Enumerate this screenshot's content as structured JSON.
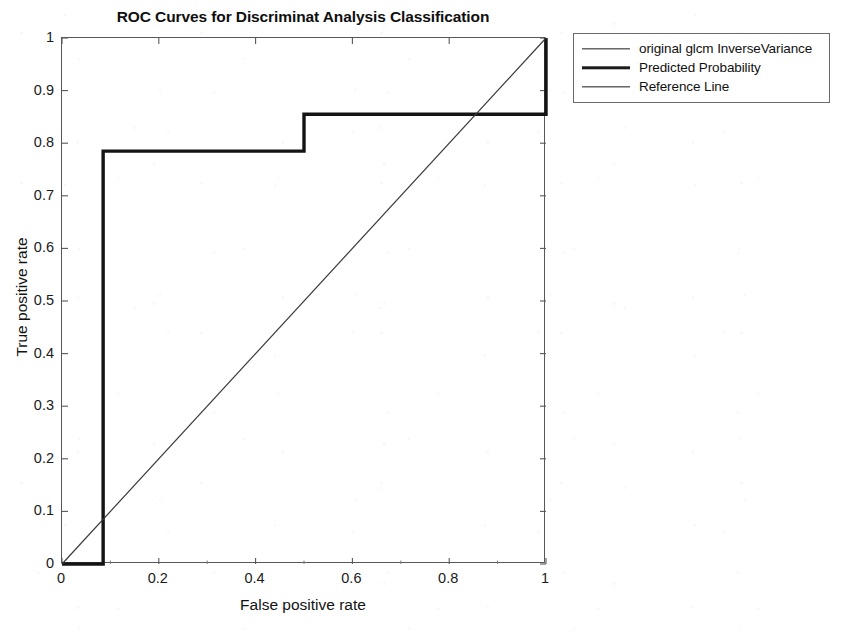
{
  "chart_data": {
    "type": "line",
    "title": "ROC Curves for Discriminat Analysis Classification",
    "xlabel": "False positive rate",
    "ylabel": "True positive rate",
    "xlim": [
      0,
      1
    ],
    "ylim": [
      0,
      1
    ],
    "grid": false,
    "legend_position": "outside-top-right",
    "xticks": [
      "0",
      "0.2",
      "0.4",
      "0.6",
      "0.8",
      "1"
    ],
    "xtick_values": [
      0,
      0.2,
      0.4,
      0.6,
      0.8,
      1
    ],
    "yticks": [
      "0",
      "0.1",
      "0.2",
      "0.3",
      "0.4",
      "0.5",
      "0.6",
      "0.7",
      "0.8",
      "0.9",
      "1"
    ],
    "ytick_values": [
      0,
      0.1,
      0.2,
      0.3,
      0.4,
      0.5,
      0.6,
      0.7,
      0.8,
      0.9,
      1
    ],
    "series": [
      {
        "name": "original glcm InverseVariance",
        "style": "thin",
        "color": "#1b1b1b",
        "linewidth": 1.3,
        "points": [
          [
            0,
            0
          ],
          [
            0.085,
            0
          ],
          [
            0.085,
            0.785
          ],
          [
            0.5,
            0.785
          ],
          [
            0.5,
            0.855
          ],
          [
            1,
            0.855
          ],
          [
            1,
            1
          ]
        ]
      },
      {
        "name": "Predicted Probability",
        "style": "thick",
        "color": "#141414",
        "linewidth": 3.4,
        "points": [
          [
            0,
            0
          ],
          [
            0.085,
            0
          ],
          [
            0.085,
            0.785
          ],
          [
            0.5,
            0.785
          ],
          [
            0.5,
            0.855
          ],
          [
            1,
            0.855
          ],
          [
            1,
            1
          ]
        ]
      },
      {
        "name": "Reference Line",
        "style": "thin",
        "color": "#3a3a3e",
        "linewidth": 1.2,
        "points": [
          [
            0,
            0
          ],
          [
            1,
            1
          ]
        ]
      }
    ]
  },
  "legend": {
    "items": [
      {
        "label": "original glcm InverseVariance",
        "style": "thin"
      },
      {
        "label": "Predicted Probability",
        "style": "thick"
      },
      {
        "label": "Reference Line",
        "style": "thin"
      }
    ]
  }
}
